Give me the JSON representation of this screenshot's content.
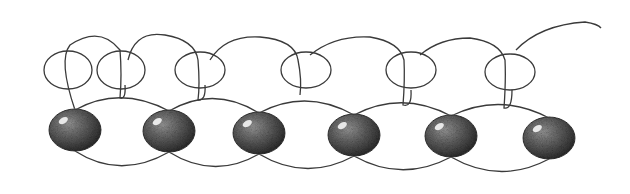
{
  "illustration": {
    "subject": "beaded thread loops",
    "colors": {
      "background": "#ffffff",
      "thread": "#3a3a3a",
      "bead_dark": "#2e2e2e",
      "bead_mid": "#6e6e6e",
      "highlight": "#e8e8e8"
    },
    "beads": [
      {
        "cx": 75,
        "cy": 130,
        "rx": 26,
        "ry": 21
      },
      {
        "cx": 169,
        "cy": 131,
        "rx": 26,
        "ry": 21
      },
      {
        "cx": 259,
        "cy": 133,
        "rx": 26,
        "ry": 21
      },
      {
        "cx": 354,
        "cy": 135,
        "rx": 26,
        "ry": 21
      },
      {
        "cx": 451,
        "cy": 136,
        "rx": 26,
        "ry": 21
      },
      {
        "cx": 549,
        "cy": 138,
        "rx": 26,
        "ry": 21
      }
    ],
    "rings": [
      {
        "cx": 68,
        "cy": 70,
        "rx": 24,
        "ry": 19
      },
      {
        "cx": 121,
        "cy": 70,
        "rx": 24,
        "ry": 19
      },
      {
        "cx": 200,
        "cy": 70,
        "rx": 25,
        "ry": 18
      },
      {
        "cx": 306,
        "cy": 70,
        "rx": 25,
        "ry": 18
      },
      {
        "cx": 411,
        "cy": 70,
        "rx": 25,
        "ry": 18
      },
      {
        "cx": 510,
        "cy": 72,
        "rx": 25,
        "ry": 18
      }
    ]
  }
}
